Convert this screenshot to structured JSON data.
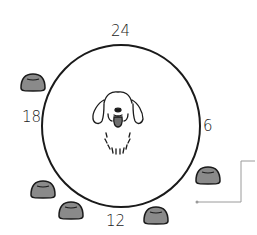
{
  "diagram": {
    "clock_labels": {
      "top": "24",
      "right": "6",
      "bottom": "12",
      "left": "18"
    },
    "center_figure": "dog-face",
    "bowls": [
      {
        "position": "upper-left",
        "x": 33,
        "y": 82
      },
      {
        "position": "lower-left",
        "x": 42,
        "y": 188
      },
      {
        "position": "bottom-left",
        "x": 70,
        "y": 210
      },
      {
        "position": "bottom-right",
        "x": 155,
        "y": 215
      },
      {
        "position": "right",
        "x": 208,
        "y": 175
      }
    ],
    "colors": {
      "stroke": "#1a1a1a",
      "bowl_fill": "#8a8a8a",
      "connector": "#9a9a9a",
      "tongue": "#6e6e6e"
    }
  }
}
